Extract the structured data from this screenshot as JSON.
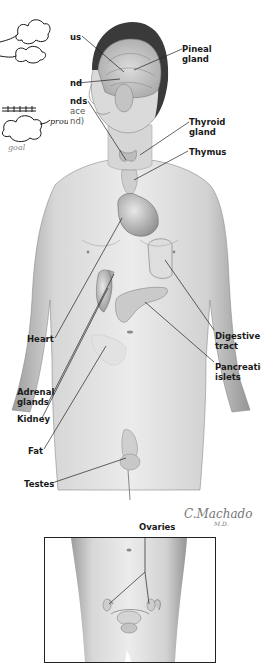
{
  "figure": {
    "signature": {
      "name": "C.Machado",
      "suffix": "M.D."
    }
  },
  "labels": {
    "hypothalamus_fragment": "us",
    "pituitary_fragment": "nd",
    "parathyroid_fragment_1": "nds",
    "parathyroid_fragment_2": "ace",
    "parathyroid_fragment_3": "nd)",
    "pineal_1": "Pineal",
    "pineal_2": "gland",
    "thyroid_1": "Thyroid",
    "thyroid_2": "gland",
    "thymus": "Thymus",
    "heart": "Heart",
    "digestive_1": "Digestive",
    "digestive_2": "tract",
    "pancreatic_1": "Pancreatic",
    "pancreatic_2": "islets",
    "adrenal_1": "Adrenal",
    "adrenal_2": "glands",
    "kidney": "Kidney",
    "fat": "Fat",
    "testes": "Testes",
    "ovaries": "Ovaries"
  },
  "overlay_sketch": {
    "description": "hand-drawn cloud shapes with arrows and scribbled words",
    "words": [
      "proud",
      "goal"
    ]
  },
  "colors": {
    "background": "#ffffff",
    "skin_light": "#e6e6e6",
    "skin_mid": "#bdbdbd",
    "skin_dark": "#8a8a8a",
    "hair": "#3a3a3a",
    "leader_line": "#222222",
    "label_text": "#1a1a1a"
  }
}
